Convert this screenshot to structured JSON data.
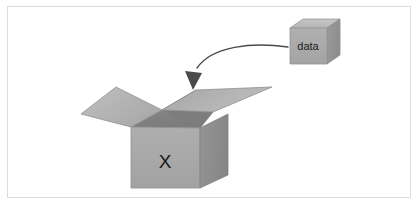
{
  "figure": {
    "title_alt": "Open box labeled X receiving data cube via curved arrow",
    "frame": {
      "border_color": "#dcdcdc",
      "background_color": "#ffffff"
    },
    "labels": {
      "box_label": "X",
      "cube_label": "data"
    },
    "colors": {
      "flap_top_light": "#b6b6b6",
      "flap_top_mid": "#a9a9a9",
      "box_front": "#a8a8a8",
      "box_side": "#8f8f8f",
      "box_interior": "#8a8a8a",
      "box_interior_dark": "#7e7e7e",
      "cube_front": "#ababab",
      "cube_top": "#bcbcbc",
      "cube_side": "#969696",
      "edge_stroke": "#9a9a9a",
      "arrow_stroke": "#4a4a4a",
      "text_color": "#1a1a1a"
    },
    "shapes": {
      "cube": {
        "name": "data-cube",
        "front": "290,28 327,28 327,64 290,64",
        "top": "290,28 303,19 340,19 327,28",
        "side": "327,28 340,19 340,55 327,64",
        "label_x": 296,
        "label_y": 52
      },
      "arrow": {
        "name": "curved-arrow",
        "path": "M 288,47 C 255,44 218,48 200,66",
        "head": "193,90 186,74 201,74"
      },
      "box": {
        "name": "open-box",
        "flap_left": "116,87 162,110 131,127 81,114",
        "flap_right": "162,110 196,90 272,87 213,112",
        "interior_back": "131,127 162,110 196,90 213,112 200,128",
        "interior_shadow": "162,110 196,90 213,112 200,128",
        "front": "131,127 200,128 200,188 131,188",
        "side": "200,128 228,114 228,175 200,188",
        "label_x": 165,
        "label_y": 163
      }
    }
  }
}
